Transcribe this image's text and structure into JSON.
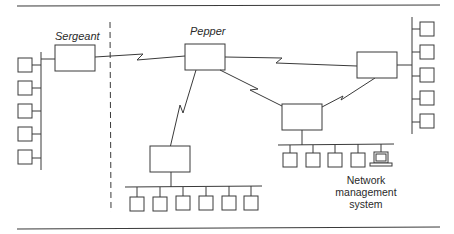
{
  "diagram": {
    "type": "network-topology",
    "nodes": [
      {
        "id": "sergeant",
        "label": "Sergeant",
        "kind": "router"
      },
      {
        "id": "pepper",
        "label": "Pepper",
        "kind": "router"
      },
      {
        "id": "right-router",
        "label": "",
        "kind": "router"
      },
      {
        "id": "bottom-middle-router",
        "label": "",
        "kind": "router"
      },
      {
        "id": "bottom-right-router",
        "label": "",
        "kind": "router"
      }
    ],
    "lans": [
      {
        "id": "left-lan",
        "attached_to": "sergeant",
        "hosts": 5
      },
      {
        "id": "right-lan",
        "attached_to": "right-router",
        "hosts": 5
      },
      {
        "id": "bottom-middle-lan",
        "attached_to": "bottom-middle-router",
        "hosts": 6
      },
      {
        "id": "bottom-right-lan",
        "attached_to": "bottom-right-router",
        "hosts": 4,
        "extra": "network-management-station"
      }
    ],
    "wan_links": [
      {
        "from": "sergeant",
        "to": "pepper",
        "style": "serial-zigzag"
      },
      {
        "from": "pepper",
        "to": "right-router",
        "style": "serial-zigzag"
      },
      {
        "from": "pepper",
        "to": "bottom-middle-router",
        "style": "serial-zigzag"
      },
      {
        "from": "pepper",
        "to": "bottom-right-router",
        "style": "serial-zigzag"
      },
      {
        "from": "bottom-right-router",
        "to": "right-router",
        "style": "serial-zigzag"
      }
    ],
    "boundary": {
      "style": "dashed",
      "separates": [
        "sergeant",
        "pepper"
      ]
    }
  },
  "labels": {
    "sergeant": "Sergeant",
    "pepper": "Pepper",
    "nms_line1": "Network",
    "nms_line2": "management",
    "nms_line3": "system"
  },
  "colors": {
    "line": "#3a3a3a",
    "background": "#ffffff",
    "text": "#2a2a2a"
  }
}
